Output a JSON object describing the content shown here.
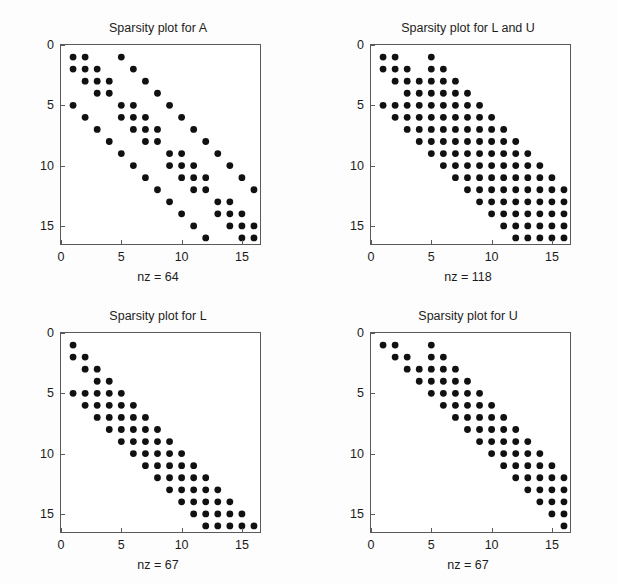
{
  "figure": {
    "background": "#fdfdfd",
    "axis_color": "#5a5a5a",
    "marker_color": "#111111",
    "width": 617,
    "height": 584
  },
  "chart_data": [
    {
      "type": "scatter",
      "name": "A",
      "title": "Sparsity plot for A",
      "nz_label": "nz = 64",
      "nz": 64,
      "xlabel": "",
      "ylabel": "",
      "xlim": [
        0,
        16.5
      ],
      "ylim": [
        16.5,
        0
      ],
      "grid": false,
      "legend": "none",
      "xticks": [
        0,
        5,
        10,
        15
      ],
      "yticks": [
        0,
        5,
        10,
        15
      ],
      "xticklabels": [
        "0",
        "5",
        "10",
        "15"
      ],
      "yticklabels": [
        "0",
        "5",
        "10",
        "15"
      ],
      "matrix_size": 16,
      "points": [
        [
          1,
          1
        ],
        [
          1,
          2
        ],
        [
          1,
          5
        ],
        [
          2,
          1
        ],
        [
          2,
          2
        ],
        [
          2,
          3
        ],
        [
          2,
          6
        ],
        [
          3,
          2
        ],
        [
          3,
          3
        ],
        [
          3,
          4
        ],
        [
          3,
          7
        ],
        [
          4,
          3
        ],
        [
          4,
          4
        ],
        [
          4,
          8
        ],
        [
          5,
          1
        ],
        [
          5,
          5
        ],
        [
          5,
          6
        ],
        [
          5,
          9
        ],
        [
          6,
          2
        ],
        [
          6,
          5
        ],
        [
          6,
          6
        ],
        [
          6,
          7
        ],
        [
          6,
          10
        ],
        [
          7,
          3
        ],
        [
          7,
          6
        ],
        [
          7,
          7
        ],
        [
          7,
          8
        ],
        [
          7,
          11
        ],
        [
          8,
          4
        ],
        [
          8,
          7
        ],
        [
          8,
          8
        ],
        [
          8,
          12
        ],
        [
          9,
          5
        ],
        [
          9,
          9
        ],
        [
          9,
          10
        ],
        [
          9,
          13
        ],
        [
          10,
          6
        ],
        [
          10,
          9
        ],
        [
          10,
          10
        ],
        [
          10,
          11
        ],
        [
          10,
          14
        ],
        [
          11,
          7
        ],
        [
          11,
          10
        ],
        [
          11,
          11
        ],
        [
          11,
          12
        ],
        [
          11,
          15
        ],
        [
          12,
          8
        ],
        [
          12,
          11
        ],
        [
          12,
          12
        ],
        [
          12,
          16
        ],
        [
          13,
          9
        ],
        [
          13,
          13
        ],
        [
          13,
          14
        ],
        [
          14,
          10
        ],
        [
          14,
          13
        ],
        [
          14,
          14
        ],
        [
          14,
          15
        ],
        [
          15,
          11
        ],
        [
          15,
          14
        ],
        [
          15,
          15
        ],
        [
          15,
          16
        ],
        [
          16,
          12
        ],
        [
          16,
          15
        ],
        [
          16,
          16
        ]
      ]
    },
    {
      "type": "scatter",
      "name": "LU",
      "title": "Sparsity plot for L and U",
      "nz_label": "nz = 118",
      "nz": 118,
      "xlabel": "",
      "ylabel": "",
      "xlim": [
        0,
        16.5
      ],
      "ylim": [
        16.5,
        0
      ],
      "grid": false,
      "legend": "none",
      "xticks": [
        0,
        5,
        10,
        15
      ],
      "yticks": [
        0,
        5,
        10,
        15
      ],
      "xticklabels": [
        "0",
        "5",
        "10",
        "15"
      ],
      "yticklabels": [
        "0",
        "5",
        "10",
        "15"
      ],
      "matrix_size": 16,
      "points": [
        [
          1,
          1
        ],
        [
          1,
          2
        ],
        [
          1,
          5
        ],
        [
          2,
          1
        ],
        [
          2,
          2
        ],
        [
          2,
          3
        ],
        [
          2,
          5
        ],
        [
          2,
          6
        ],
        [
          3,
          2
        ],
        [
          3,
          3
        ],
        [
          3,
          4
        ],
        [
          3,
          5
        ],
        [
          3,
          6
        ],
        [
          3,
          7
        ],
        [
          4,
          3
        ],
        [
          4,
          4
        ],
        [
          4,
          5
        ],
        [
          4,
          6
        ],
        [
          4,
          7
        ],
        [
          4,
          8
        ],
        [
          5,
          1
        ],
        [
          5,
          2
        ],
        [
          5,
          3
        ],
        [
          5,
          4
        ],
        [
          5,
          5
        ],
        [
          5,
          6
        ],
        [
          5,
          7
        ],
        [
          5,
          8
        ],
        [
          5,
          9
        ],
        [
          6,
          2
        ],
        [
          6,
          3
        ],
        [
          6,
          4
        ],
        [
          6,
          5
        ],
        [
          6,
          6
        ],
        [
          6,
          7
        ],
        [
          6,
          8
        ],
        [
          6,
          9
        ],
        [
          6,
          10
        ],
        [
          7,
          3
        ],
        [
          7,
          4
        ],
        [
          7,
          5
        ],
        [
          7,
          6
        ],
        [
          7,
          7
        ],
        [
          7,
          8
        ],
        [
          7,
          9
        ],
        [
          7,
          10
        ],
        [
          7,
          11
        ],
        [
          8,
          4
        ],
        [
          8,
          5
        ],
        [
          8,
          6
        ],
        [
          8,
          7
        ],
        [
          8,
          8
        ],
        [
          8,
          9
        ],
        [
          8,
          10
        ],
        [
          8,
          11
        ],
        [
          8,
          12
        ],
        [
          9,
          5
        ],
        [
          9,
          6
        ],
        [
          9,
          7
        ],
        [
          9,
          8
        ],
        [
          9,
          9
        ],
        [
          9,
          10
        ],
        [
          9,
          11
        ],
        [
          9,
          12
        ],
        [
          9,
          13
        ],
        [
          10,
          6
        ],
        [
          10,
          7
        ],
        [
          10,
          8
        ],
        [
          10,
          9
        ],
        [
          10,
          10
        ],
        [
          10,
          11
        ],
        [
          10,
          12
        ],
        [
          10,
          13
        ],
        [
          10,
          14
        ],
        [
          11,
          7
        ],
        [
          11,
          8
        ],
        [
          11,
          9
        ],
        [
          11,
          10
        ],
        [
          11,
          11
        ],
        [
          11,
          12
        ],
        [
          11,
          13
        ],
        [
          11,
          14
        ],
        [
          11,
          15
        ],
        [
          12,
          8
        ],
        [
          12,
          9
        ],
        [
          12,
          10
        ],
        [
          12,
          11
        ],
        [
          12,
          12
        ],
        [
          12,
          13
        ],
        [
          12,
          14
        ],
        [
          12,
          15
        ],
        [
          12,
          16
        ],
        [
          13,
          9
        ],
        [
          13,
          10
        ],
        [
          13,
          11
        ],
        [
          13,
          12
        ],
        [
          13,
          13
        ],
        [
          13,
          14
        ],
        [
          13,
          15
        ],
        [
          13,
          16
        ],
        [
          14,
          10
        ],
        [
          14,
          11
        ],
        [
          14,
          12
        ],
        [
          14,
          13
        ],
        [
          14,
          14
        ],
        [
          14,
          15
        ],
        [
          14,
          16
        ],
        [
          15,
          11
        ],
        [
          15,
          12
        ],
        [
          15,
          13
        ],
        [
          15,
          14
        ],
        [
          15,
          15
        ],
        [
          15,
          16
        ],
        [
          16,
          12
        ],
        [
          16,
          13
        ],
        [
          16,
          14
        ],
        [
          16,
          15
        ],
        [
          16,
          16
        ]
      ]
    },
    {
      "type": "scatter",
      "name": "L",
      "title": "Sparsity plot for L",
      "nz_label": "nz = 67",
      "nz": 67,
      "xlabel": "",
      "ylabel": "",
      "xlim": [
        0,
        16.5
      ],
      "ylim": [
        16.5,
        0
      ],
      "grid": false,
      "legend": "none",
      "xticks": [
        0,
        5,
        10,
        15
      ],
      "yticks": [
        0,
        5,
        10,
        15
      ],
      "xticklabels": [
        "0",
        "5",
        "10",
        "15"
      ],
      "yticklabels": [
        "0",
        "5",
        "10",
        "15"
      ],
      "matrix_size": 16,
      "points": [
        [
          1,
          1
        ],
        [
          2,
          1
        ],
        [
          2,
          2
        ],
        [
          3,
          2
        ],
        [
          3,
          3
        ],
        [
          4,
          3
        ],
        [
          4,
          4
        ],
        [
          5,
          1
        ],
        [
          5,
          2
        ],
        [
          5,
          3
        ],
        [
          5,
          4
        ],
        [
          5,
          5
        ],
        [
          6,
          2
        ],
        [
          6,
          3
        ],
        [
          6,
          4
        ],
        [
          6,
          5
        ],
        [
          6,
          6
        ],
        [
          7,
          3
        ],
        [
          7,
          4
        ],
        [
          7,
          5
        ],
        [
          7,
          6
        ],
        [
          7,
          7
        ],
        [
          8,
          4
        ],
        [
          8,
          5
        ],
        [
          8,
          6
        ],
        [
          8,
          7
        ],
        [
          8,
          8
        ],
        [
          9,
          5
        ],
        [
          9,
          6
        ],
        [
          9,
          7
        ],
        [
          9,
          8
        ],
        [
          9,
          9
        ],
        [
          10,
          6
        ],
        [
          10,
          7
        ],
        [
          10,
          8
        ],
        [
          10,
          9
        ],
        [
          10,
          10
        ],
        [
          11,
          7
        ],
        [
          11,
          8
        ],
        [
          11,
          9
        ],
        [
          11,
          10
        ],
        [
          11,
          11
        ],
        [
          12,
          8
        ],
        [
          12,
          9
        ],
        [
          12,
          10
        ],
        [
          12,
          11
        ],
        [
          12,
          12
        ],
        [
          13,
          9
        ],
        [
          13,
          10
        ],
        [
          13,
          11
        ],
        [
          13,
          12
        ],
        [
          13,
          13
        ],
        [
          14,
          10
        ],
        [
          14,
          11
        ],
        [
          14,
          12
        ],
        [
          14,
          13
        ],
        [
          14,
          14
        ],
        [
          15,
          11
        ],
        [
          15,
          12
        ],
        [
          15,
          13
        ],
        [
          15,
          14
        ],
        [
          15,
          15
        ],
        [
          16,
          12
        ],
        [
          16,
          13
        ],
        [
          16,
          14
        ],
        [
          16,
          15
        ],
        [
          16,
          16
        ]
      ]
    },
    {
      "type": "scatter",
      "name": "U",
      "title": "Sparsity plot for U",
      "nz_label": "nz = 67",
      "nz": 67,
      "xlabel": "",
      "ylabel": "",
      "xlim": [
        0,
        16.5
      ],
      "ylim": [
        16.5,
        0
      ],
      "grid": false,
      "legend": "none",
      "xticks": [
        0,
        5,
        10,
        15
      ],
      "yticks": [
        0,
        5,
        10,
        15
      ],
      "xticklabels": [
        "0",
        "5",
        "10",
        "15"
      ],
      "yticklabels": [
        "0",
        "5",
        "10",
        "15"
      ],
      "matrix_size": 16,
      "points": [
        [
          1,
          1
        ],
        [
          1,
          2
        ],
        [
          1,
          5
        ],
        [
          2,
          2
        ],
        [
          2,
          3
        ],
        [
          2,
          5
        ],
        [
          2,
          6
        ],
        [
          3,
          3
        ],
        [
          3,
          4
        ],
        [
          3,
          5
        ],
        [
          3,
          6
        ],
        [
          3,
          7
        ],
        [
          4,
          4
        ],
        [
          4,
          5
        ],
        [
          4,
          6
        ],
        [
          4,
          7
        ],
        [
          4,
          8
        ],
        [
          5,
          5
        ],
        [
          5,
          6
        ],
        [
          5,
          7
        ],
        [
          5,
          8
        ],
        [
          5,
          9
        ],
        [
          6,
          6
        ],
        [
          6,
          7
        ],
        [
          6,
          8
        ],
        [
          6,
          9
        ],
        [
          6,
          10
        ],
        [
          7,
          7
        ],
        [
          7,
          8
        ],
        [
          7,
          9
        ],
        [
          7,
          10
        ],
        [
          7,
          11
        ],
        [
          8,
          8
        ],
        [
          8,
          9
        ],
        [
          8,
          10
        ],
        [
          8,
          11
        ],
        [
          8,
          12
        ],
        [
          9,
          9
        ],
        [
          9,
          10
        ],
        [
          9,
          11
        ],
        [
          9,
          12
        ],
        [
          9,
          13
        ],
        [
          10,
          10
        ],
        [
          10,
          11
        ],
        [
          10,
          12
        ],
        [
          10,
          13
        ],
        [
          10,
          14
        ],
        [
          11,
          11
        ],
        [
          11,
          12
        ],
        [
          11,
          13
        ],
        [
          11,
          14
        ],
        [
          11,
          15
        ],
        [
          12,
          12
        ],
        [
          12,
          13
        ],
        [
          12,
          14
        ],
        [
          12,
          15
        ],
        [
          12,
          16
        ],
        [
          13,
          13
        ],
        [
          13,
          14
        ],
        [
          13,
          15
        ],
        [
          13,
          16
        ],
        [
          14,
          14
        ],
        [
          14,
          15
        ],
        [
          14,
          16
        ],
        [
          15,
          15
        ],
        [
          15,
          16
        ],
        [
          16,
          16
        ]
      ]
    }
  ],
  "subplots": [
    {
      "id": "a",
      "title": "Sparsity plot for A",
      "nz_label": "nz = 64"
    },
    {
      "id": "lu",
      "title": "Sparsity plot for L and U",
      "nz_label": "nz = 118"
    },
    {
      "id": "l",
      "title": "Sparsity plot for L",
      "nz_label": "nz = 67"
    },
    {
      "id": "u",
      "title": "Sparsity plot for U",
      "nz_label": "nz = 67"
    }
  ]
}
